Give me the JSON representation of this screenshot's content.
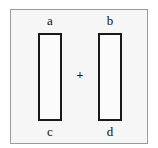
{
  "diagram": {
    "labels": {
      "top_left": "a",
      "top_right": "b",
      "bottom_left": "c",
      "bottom_right": "d"
    },
    "center_symbol": "+",
    "colors": {
      "stroke": "#1a1a1a",
      "frame": "#9a9a9a",
      "background": "#f6f6f6"
    }
  }
}
